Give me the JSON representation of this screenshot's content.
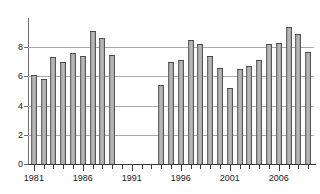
{
  "chart_data": {
    "type": "bar",
    "title": "",
    "subtitle": "",
    "xlabel": "",
    "ylabel": "",
    "grid": true,
    "legend": null,
    "xlim": [
      1980.4,
      2009.6
    ],
    "ylim": [
      0,
      10
    ],
    "y_ticks": [
      0,
      2,
      4,
      6,
      8
    ],
    "y_tick_labels": [
      "0",
      "2",
      "4",
      "6",
      "8"
    ],
    "x_tick_labels": [
      "1981",
      "1986",
      "1991",
      "1996",
      "2001",
      "2006"
    ],
    "x_tick_label_years": [
      1981,
      1986,
      1991,
      1996,
      2001,
      2006
    ],
    "categories": [
      1981,
      1982,
      1983,
      1984,
      1985,
      1986,
      1987,
      1988,
      1989,
      1990,
      1991,
      1992,
      1993,
      1994,
      1995,
      1996,
      1997,
      1998,
      1999,
      2000,
      2001,
      2002,
      2003,
      2004,
      2005,
      2006,
      2007,
      2008,
      2009
    ],
    "values": [
      6.1,
      5.8,
      7.3,
      7.0,
      7.6,
      7.4,
      9.1,
      8.6,
      7.5,
      null,
      null,
      null,
      null,
      5.4,
      7.0,
      7.1,
      8.5,
      8.2,
      7.4,
      6.6,
      5.2,
      6.5,
      6.7,
      7.1,
      8.2,
      8.3,
      9.4,
      8.9,
      7.7
    ],
    "missing_years": [
      1990,
      1991,
      1992,
      1993
    ],
    "bar_color": "#9a9a9a",
    "bar_edge_color": "#4a4a4a",
    "grid_color": "#a8a8a8",
    "axis_color": "#3a3a3a",
    "background_color": "#ffffff"
  }
}
